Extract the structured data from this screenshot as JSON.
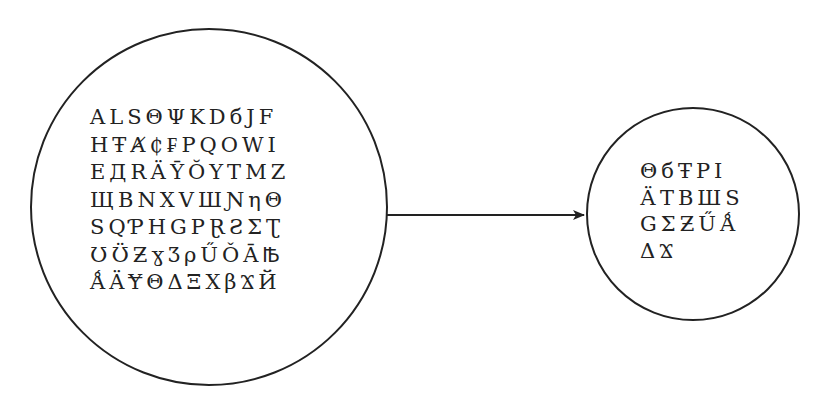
{
  "diagram": {
    "source_set": {
      "shape": "circle",
      "rows": [
        [
          "A",
          "L",
          "S",
          "Θ",
          "Ψ",
          "K",
          "D",
          "б",
          "J",
          "F"
        ],
        [
          "H",
          "Ŧ",
          "Ⱥ",
          "₵",
          "₣",
          "P",
          "Q",
          "O",
          "W",
          "I"
        ],
        [
          "E",
          "Д",
          "R",
          "Ӓ",
          "Ȳ",
          "Ŏ",
          "Y",
          "T",
          "M",
          "Z"
        ],
        [
          "Щ",
          "B",
          "N",
          "X",
          "V",
          "Ш",
          "Ɲ",
          "η",
          "Θ"
        ],
        [
          "S",
          "Ԛ",
          "Ƥ",
          "H",
          "G",
          "P",
          "Ɽ",
          "Ƨ",
          "Σ",
          "Ʈ"
        ],
        [
          "Ʊ",
          "Ʊ̈",
          "Ƶ",
          "ɣ",
          "Ʒ",
          "ρ",
          "Ű",
          "Ǒ",
          "Ā",
          "Ꙓ"
        ],
        [
          "Ǻ",
          "Ä",
          "Ɏ",
          "Θ",
          "Δ",
          "Ξ",
          "X",
          "β",
          "Ϫ",
          "Й"
        ]
      ]
    },
    "arrow": {
      "direction": "right"
    },
    "target_set": {
      "shape": "circle",
      "rows": [
        [
          "Θ",
          "б",
          "Ŧ",
          "P",
          "I"
        ],
        [
          "Ӓ",
          "T",
          "B",
          "Ш",
          "S"
        ],
        [
          "G",
          "Σ",
          "Ƶ",
          "Ű",
          "Ǻ"
        ],
        [
          "Δ",
          "Ϫ"
        ]
      ]
    },
    "colors": {
      "stroke": "#222222",
      "background": "#ffffff"
    }
  }
}
